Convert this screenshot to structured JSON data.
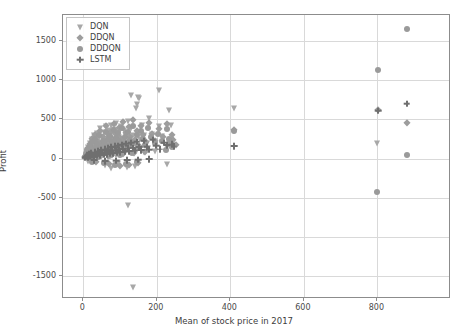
{
  "chart_data": {
    "type": "scatter",
    "title": "",
    "xlabel": "Mean of stock price in 2017",
    "ylabel": "Profit",
    "xlim": [
      -55,
      1000
    ],
    "ylim": [
      -1790,
      1830
    ],
    "xticks": [
      0,
      200,
      400,
      600,
      800
    ],
    "yticks": [
      -1500,
      -1000,
      -500,
      0,
      500,
      1000,
      1500
    ],
    "xticklabels": [
      "0",
      "200",
      "400",
      "600",
      "800"
    ],
    "yticklabels": [
      "-1500",
      "-1000",
      "-500",
      "0",
      "500",
      "1000",
      "1500"
    ],
    "grid": true,
    "legend_position": "upper left",
    "legend_entries": [
      {
        "name": "DQN",
        "marker": "triangle-down",
        "color": "#a8a8a8"
      },
      {
        "name": "DDQN",
        "marker": "diamond",
        "color": "#9d9d9d"
      },
      {
        "name": "DDDQN",
        "marker": "circle",
        "color": "#9a9a9a"
      },
      {
        "name": "LSTM",
        "marker": "plus",
        "color": "#6f6f6f"
      }
    ],
    "series": [
      {
        "name": "DQN",
        "marker": "triangle-down",
        "color": "#a8a8a8",
        "points": [
          [
            8,
            40
          ],
          [
            10,
            95
          ],
          [
            12,
            -30
          ],
          [
            14,
            150
          ],
          [
            16,
            60
          ],
          [
            18,
            205
          ],
          [
            20,
            20
          ],
          [
            22,
            130
          ],
          [
            24,
            245
          ],
          [
            26,
            70
          ],
          [
            28,
            175
          ],
          [
            30,
            300
          ],
          [
            32,
            55
          ],
          [
            34,
            215
          ],
          [
            36,
            120
          ],
          [
            38,
            330
          ],
          [
            40,
            85
          ],
          [
            42,
            260
          ],
          [
            44,
            160
          ],
          [
            46,
            395
          ],
          [
            48,
            100
          ],
          [
            50,
            275
          ],
          [
            52,
            190
          ],
          [
            54,
            60
          ],
          [
            56,
            345
          ],
          [
            58,
            230
          ],
          [
            60,
            130
          ],
          [
            62,
            410
          ],
          [
            64,
            175
          ],
          [
            66,
            290
          ],
          [
            68,
            95
          ],
          [
            70,
            360
          ],
          [
            72,
            215
          ],
          [
            74,
            150
          ],
          [
            76,
            430
          ],
          [
            78,
            250
          ],
          [
            80,
            120
          ],
          [
            82,
            380
          ],
          [
            84,
            195
          ],
          [
            86,
            305
          ],
          [
            88,
            165
          ],
          [
            90,
            455
          ],
          [
            92,
            235
          ],
          [
            94,
            140
          ],
          [
            96,
            340
          ],
          [
            98,
            270
          ],
          [
            100,
            185
          ],
          [
            103,
            420
          ],
          [
            106,
            255
          ],
          [
            109,
            160
          ],
          [
            112,
            370
          ],
          [
            115,
            285
          ],
          [
            118,
            205
          ],
          [
            121,
            480
          ],
          [
            124,
            230
          ],
          [
            127,
            175
          ],
          [
            130,
            395
          ],
          [
            134,
            300
          ],
          [
            138,
            215
          ],
          [
            142,
            640
          ],
          [
            146,
            700
          ],
          [
            150,
            330
          ],
          [
            155,
            250
          ],
          [
            160,
            430
          ],
          [
            165,
            300
          ],
          [
            172,
            200
          ],
          [
            180,
            520
          ],
          [
            188,
            310
          ],
          [
            196,
            230
          ],
          [
            205,
            410
          ],
          [
            215,
            290
          ],
          [
            60,
            -80
          ],
          [
            75,
            -120
          ],
          [
            95,
            -60
          ],
          [
            118,
            -110
          ],
          [
            140,
            -90
          ],
          [
            130,
            810
          ],
          [
            148,
            790
          ],
          [
            152,
            770
          ],
          [
            121,
            -590
          ],
          [
            135,
            -1640
          ],
          [
            205,
            870
          ],
          [
            228,
            150
          ],
          [
            232,
            620
          ],
          [
            410,
            650
          ],
          [
            228,
            -70
          ],
          [
            800,
            200
          ],
          [
            238,
            430
          ],
          [
            196,
            95
          ],
          [
            176,
            130
          ],
          [
            166,
            90
          ],
          [
            145,
            165
          ],
          [
            112,
            100
          ],
          [
            88,
            48
          ],
          [
            68,
            22
          ],
          [
            44,
            18
          ],
          [
            28,
            12
          ],
          [
            16,
            8
          ]
        ]
      },
      {
        "name": "DDQN",
        "marker": "diamond",
        "color": "#9d9d9d",
        "points": [
          [
            6,
            25
          ],
          [
            9,
            80
          ],
          [
            12,
            140
          ],
          [
            15,
            45
          ],
          [
            18,
            190
          ],
          [
            21,
            95
          ],
          [
            24,
            250
          ],
          [
            27,
            130
          ],
          [
            30,
            60
          ],
          [
            33,
            300
          ],
          [
            36,
            165
          ],
          [
            39,
            215
          ],
          [
            42,
            85
          ],
          [
            45,
            355
          ],
          [
            48,
            190
          ],
          [
            51,
            120
          ],
          [
            54,
            270
          ],
          [
            57,
            230
          ],
          [
            60,
            150
          ],
          [
            63,
            410
          ],
          [
            66,
            195
          ],
          [
            69,
            290
          ],
          [
            72,
            110
          ],
          [
            75,
            340
          ],
          [
            78,
            245
          ],
          [
            81,
            170
          ],
          [
            84,
            440
          ],
          [
            87,
            215
          ],
          [
            90,
            310
          ],
          [
            93,
            135
          ],
          [
            96,
            385
          ],
          [
            99,
            260
          ],
          [
            103,
            180
          ],
          [
            107,
            470
          ],
          [
            111,
            225
          ],
          [
            115,
            330
          ],
          [
            119,
            145
          ],
          [
            123,
            400
          ],
          [
            127,
            280
          ],
          [
            131,
            195
          ],
          [
            136,
            490
          ],
          [
            141,
            240
          ],
          [
            146,
            350
          ],
          [
            151,
            165
          ],
          [
            157,
            420
          ],
          [
            163,
            295
          ],
          [
            170,
            210
          ],
          [
            178,
            460
          ],
          [
            186,
            320
          ],
          [
            195,
            230
          ],
          [
            205,
            380
          ],
          [
            216,
            270
          ],
          [
            228,
            445
          ],
          [
            240,
            300
          ],
          [
            238,
            200
          ],
          [
            245,
            235
          ],
          [
            252,
            175
          ],
          [
            410,
            370
          ],
          [
            880,
            450
          ],
          [
            802,
            615
          ],
          [
            70,
            -70
          ],
          [
            100,
            -95
          ],
          [
            125,
            -75
          ],
          [
            150,
            -55
          ],
          [
            35,
            -45
          ],
          [
            20,
            15
          ],
          [
            48,
            28
          ],
          [
            78,
            40
          ],
          [
            108,
            55
          ],
          [
            138,
            70
          ],
          [
            168,
            85
          ]
        ]
      },
      {
        "name": "DDDQN",
        "marker": "circle",
        "color": "#9a9a9a",
        "points": [
          [
            5,
            18
          ],
          [
            8,
            55
          ],
          [
            11,
            110
          ],
          [
            14,
            30
          ],
          [
            17,
            160
          ],
          [
            20,
            75
          ],
          [
            23,
            210
          ],
          [
            26,
            105
          ],
          [
            29,
            48
          ],
          [
            32,
            255
          ],
          [
            35,
            140
          ],
          [
            38,
            185
          ],
          [
            41,
            70
          ],
          [
            44,
            300
          ],
          [
            47,
            160
          ],
          [
            50,
            100
          ],
          [
            53,
            230
          ],
          [
            56,
            195
          ],
          [
            59,
            125
          ],
          [
            62,
            345
          ],
          [
            65,
            165
          ],
          [
            68,
            245
          ],
          [
            71,
            92
          ],
          [
            74,
            285
          ],
          [
            77,
            208
          ],
          [
            80,
            143
          ],
          [
            83,
            370
          ],
          [
            86,
            180
          ],
          [
            89,
            262
          ],
          [
            92,
            115
          ],
          [
            95,
            325
          ],
          [
            98,
            220
          ],
          [
            102,
            152
          ],
          [
            106,
            395
          ],
          [
            110,
            190
          ],
          [
            114,
            280
          ],
          [
            118,
            122
          ],
          [
            122,
            340
          ],
          [
            126,
            238
          ],
          [
            130,
            165
          ],
          [
            135,
            415
          ],
          [
            140,
            205
          ],
          [
            145,
            295
          ],
          [
            150,
            140
          ],
          [
            156,
            355
          ],
          [
            162,
            250
          ],
          [
            169,
            178
          ],
          [
            177,
            390
          ],
          [
            185,
            270
          ],
          [
            194,
            196
          ],
          [
            204,
            320
          ],
          [
            215,
            228
          ],
          [
            227,
            375
          ],
          [
            234,
            255
          ],
          [
            240,
            150
          ],
          [
            410,
            350
          ],
          [
            880,
            1650
          ],
          [
            802,
            1130
          ],
          [
            800,
            -420
          ],
          [
            880,
            40
          ],
          [
            55,
            -60
          ],
          [
            85,
            -85
          ],
          [
            115,
            -65
          ],
          [
            145,
            -48
          ],
          [
            25,
            -38
          ],
          [
            232,
            180
          ],
          [
            224,
            110
          ],
          [
            15,
            12
          ],
          [
            40,
            25
          ],
          [
            70,
            38
          ],
          [
            100,
            52
          ],
          [
            132,
            66
          ]
        ]
      },
      {
        "name": "LSTM",
        "marker": "plus",
        "color": "#6f6f6f",
        "points": [
          [
            4,
            10
          ],
          [
            7,
            25
          ],
          [
            10,
            40
          ],
          [
            13,
            18
          ],
          [
            16,
            55
          ],
          [
            19,
            32
          ],
          [
            22,
            68
          ],
          [
            25,
            45
          ],
          [
            28,
            22
          ],
          [
            31,
            80
          ],
          [
            34,
            58
          ],
          [
            37,
            36
          ],
          [
            40,
            92
          ],
          [
            43,
            66
          ],
          [
            46,
            44
          ],
          [
            49,
            105
          ],
          [
            52,
            74
          ],
          [
            55,
            50
          ],
          [
            58,
            118
          ],
          [
            61,
            82
          ],
          [
            64,
            58
          ],
          [
            67,
            130
          ],
          [
            70,
            90
          ],
          [
            73,
            64
          ],
          [
            76,
            142
          ],
          [
            79,
            98
          ],
          [
            82,
            70
          ],
          [
            85,
            155
          ],
          [
            88,
            106
          ],
          [
            91,
            76
          ],
          [
            94,
            166
          ],
          [
            97,
            114
          ],
          [
            101,
            82
          ],
          [
            105,
            178
          ],
          [
            109,
            122
          ],
          [
            113,
            88
          ],
          [
            117,
            190
          ],
          [
            121,
            130
          ],
          [
            125,
            94
          ],
          [
            130,
            202
          ],
          [
            135,
            138
          ],
          [
            140,
            100
          ],
          [
            146,
            214
          ],
          [
            152,
            146
          ],
          [
            158,
            106
          ],
          [
            165,
            226
          ],
          [
            172,
            154
          ],
          [
            180,
            112
          ],
          [
            189,
            238
          ],
          [
            198,
            162
          ],
          [
            208,
            120
          ],
          [
            219,
            200
          ],
          [
            228,
            168
          ],
          [
            240,
            185
          ],
          [
            246,
            155
          ],
          [
            410,
            155
          ],
          [
            802,
            612
          ],
          [
            880,
            700
          ],
          [
            30,
            -20
          ],
          [
            60,
            -35
          ],
          [
            90,
            -28
          ],
          [
            120,
            -22
          ],
          [
            150,
            -15
          ],
          [
            180,
            -10
          ]
        ]
      }
    ]
  }
}
